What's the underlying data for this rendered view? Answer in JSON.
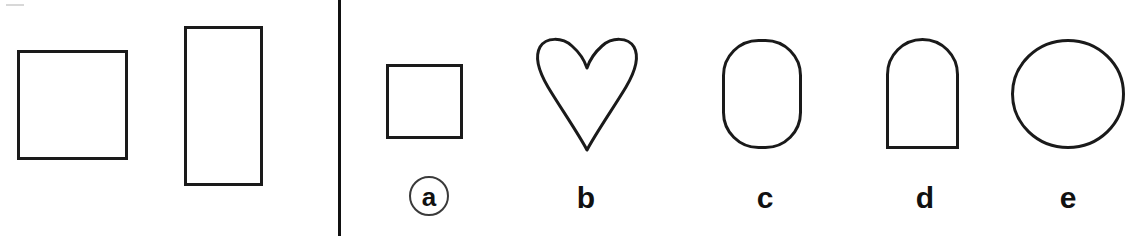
{
  "figure": {
    "background_color": "#ffffff",
    "stroke_color": "#1a1a1a",
    "label_color": "#111111",
    "width": 1135,
    "height": 236
  },
  "divider": {
    "name": "vertical-rule",
    "color": "#111111",
    "x": 338,
    "width": 3
  },
  "left_panel": {
    "name": "reference-shapes-panel",
    "shapes": [
      {
        "id": "ref-square",
        "kind": "square",
        "label": "",
        "x": 17,
        "y": 50,
        "width": 111,
        "height": 110,
        "stroke_width": 3
      },
      {
        "id": "ref-rectangle",
        "kind": "rectangle",
        "label": "",
        "x": 184,
        "y": 26,
        "width": 79,
        "height": 160,
        "stroke_width": 3
      }
    ]
  },
  "right_panel": {
    "name": "labeled-shapes-panel",
    "shapes": [
      {
        "id": "shape-a",
        "kind": "square",
        "label": "a",
        "label_circled": true,
        "x": 386,
        "y": 64,
        "width": 77,
        "height": 75,
        "stroke_width": 3,
        "label_center_x": 429,
        "label_top": 176
      },
      {
        "id": "shape-b",
        "kind": "heart",
        "label": "b",
        "label_circled": false,
        "x": 534,
        "y": 37,
        "width": 106,
        "height": 114,
        "stroke_width": 3,
        "label_center_x": 586,
        "label_top": 183
      },
      {
        "id": "shape-c",
        "kind": "stadium",
        "label": "c",
        "label_circled": false,
        "x": 722,
        "y": 39,
        "width": 80,
        "height": 110,
        "corner_radius": 35,
        "stroke_width": 3,
        "label_center_x": 765,
        "label_top": 183
      },
      {
        "id": "shape-d",
        "kind": "arch",
        "label": "d",
        "label_circled": false,
        "x": 886,
        "y": 37,
        "width": 73,
        "height": 112,
        "corner_radius": 36,
        "stroke_width": 3,
        "label_center_x": 925,
        "label_top": 183
      },
      {
        "id": "shape-e",
        "kind": "circle",
        "label": "e",
        "label_circled": false,
        "x": 1011,
        "y": 39,
        "width": 114,
        "height": 110,
        "stroke_width": 3,
        "label_center_x": 1068,
        "label_top": 183
      }
    ]
  }
}
